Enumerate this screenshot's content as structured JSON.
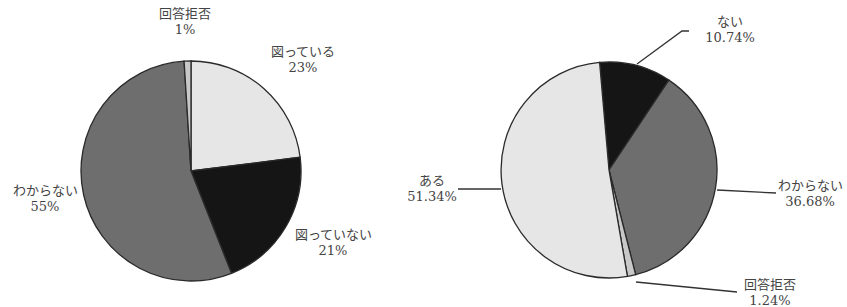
{
  "chart_data": [
    {
      "type": "pie",
      "title": "",
      "start_angle_deg": 0,
      "direction": "clockwise",
      "slices": [
        {
          "label": "図っている",
          "value": 23,
          "value_label": "23%",
          "color": "#e6e6e6"
        },
        {
          "label": "図っていない",
          "value": 21,
          "value_label": "21%",
          "color": "#151515"
        },
        {
          "label": "わからない",
          "value": 55,
          "value_label": "55%",
          "color": "#6e6e6e"
        },
        {
          "label": "回答拒否",
          "value": 1,
          "value_label": "1%",
          "color": "#c8c8c8"
        }
      ],
      "legend": "none (data labels)"
    },
    {
      "type": "pie",
      "title": "",
      "start_angle_deg": -5,
      "direction": "clockwise",
      "slices": [
        {
          "label": "ない",
          "value": 10.74,
          "value_label": "10.74%",
          "color": "#151515"
        },
        {
          "label": "わからない",
          "value": 36.68,
          "value_label": "36.68%",
          "color": "#6e6e6e"
        },
        {
          "label": "回答拒否",
          "value": 1.24,
          "value_label": "1.24%",
          "color": "#c8c8c8"
        },
        {
          "label": "ある",
          "value": 51.34,
          "value_label": "51.34%",
          "color": "#e6e6e6"
        }
      ],
      "legend": "none (data labels with leader lines)"
    }
  ]
}
